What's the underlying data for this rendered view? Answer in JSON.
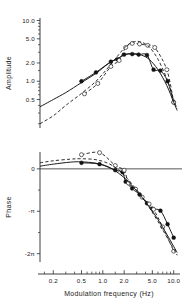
{
  "figure": {
    "caption_present": false,
    "panels": [
      "amplitude",
      "phase"
    ]
  },
  "chart_data": [
    {
      "type": "line",
      "panel": "amplitude",
      "title": "",
      "xlabel": "",
      "ylabel": "Amplitude",
      "xscale": "log",
      "yscale": "log",
      "xlim": [
        0.13,
        11.5
      ],
      "ylim": [
        0.17,
        11.0
      ],
      "grid": false,
      "legend": "none",
      "xticks": [
        0.2,
        0.5,
        1.0,
        2.0,
        5.0,
        10.0
      ],
      "xticklabels": [
        "0.2",
        "0.5",
        "1.0",
        "2.0",
        "5.0",
        "10.0"
      ],
      "yticks": [
        0.5,
        1.0,
        2.0,
        5.0,
        10.0
      ],
      "yticklabels": [
        "0.5",
        "1.0",
        "2.0",
        "5.0",
        "10.0"
      ],
      "series": [
        {
          "name": "filled-circles-solid",
          "marker": "filled-circle",
          "line": "solid",
          "x": [
            0.5,
            0.8,
            1.3,
            1.6,
            2.0,
            2.6,
            3.2,
            4.2,
            5.2,
            6.5,
            8.2,
            10.0
          ],
          "y": [
            1.0,
            1.4,
            2.1,
            2.3,
            2.75,
            2.8,
            2.75,
            2.7,
            1.55,
            1.5,
            1.0,
            0.45
          ]
        },
        {
          "name": "open-circles-dashed",
          "marker": "open-circle",
          "line": "dashed",
          "x": [
            0.55,
            0.85,
            1.3,
            1.7,
            2.1,
            2.6,
            3.3,
            4.3,
            5.4,
            8.0,
            10.0
          ],
          "y": [
            0.62,
            0.92,
            1.75,
            2.2,
            3.6,
            4.2,
            4.1,
            3.9,
            3.6,
            1.55,
            0.45
          ]
        },
        {
          "name": "fit-solid",
          "line": "solid",
          "x": [
            0.13,
            0.2,
            0.3,
            0.5,
            0.8,
            1.2,
            1.7,
            2.2,
            2.8,
            3.5,
            4.5,
            6.0,
            8.0,
            10.0,
            11.2
          ],
          "y": [
            0.38,
            0.5,
            0.65,
            0.95,
            1.35,
            1.95,
            2.45,
            2.8,
            2.85,
            2.7,
            2.3,
            1.55,
            0.85,
            0.45,
            0.33
          ]
        },
        {
          "name": "fit-dashed",
          "line": "dashed",
          "x": [
            0.13,
            0.2,
            0.3,
            0.5,
            0.8,
            1.2,
            1.7,
            2.2,
            2.8,
            3.5,
            4.5,
            6.0,
            8.0,
            10.0,
            11.2
          ],
          "y": [
            0.2,
            0.27,
            0.4,
            0.63,
            1.0,
            1.7,
            2.8,
            3.9,
            4.5,
            4.4,
            3.7,
            2.3,
            1.1,
            0.5,
            0.35
          ]
        }
      ]
    },
    {
      "type": "line",
      "panel": "phase",
      "title": "",
      "xlabel": "Modulation frequency (Hz)",
      "ylabel": "Phase",
      "xscale": "log",
      "yscale": "linear",
      "xlim": [
        0.13,
        11.5
      ],
      "ylim": [
        -6.9,
        1.25
      ],
      "grid": false,
      "legend": "none",
      "xticks": [
        0.2,
        0.5,
        1.0,
        2.0,
        5.0,
        10.0
      ],
      "xticklabels": [
        "0.2",
        "0.5",
        "1.0",
        "2.0",
        "5.0",
        "10.0"
      ],
      "yticks": [
        0,
        -3.1416,
        -6.2832
      ],
      "yticklabels": [
        "0",
        "-π",
        "-2π"
      ],
      "zero_line": true,
      "series": [
        {
          "name": "filled-circles-solid",
          "marker": "filled-circle",
          "line": "solid",
          "x": [
            0.5,
            0.9,
            1.5,
            1.9,
            2.1,
            2.6,
            3.3,
            4.2,
            5.0,
            6.5,
            8.2,
            10.0
          ],
          "y": [
            0.45,
            0.35,
            -0.1,
            -0.25,
            -0.95,
            -1.45,
            -1.9,
            -2.55,
            -2.95,
            -3.1,
            -4.1,
            -5.1
          ]
        },
        {
          "name": "open-circles-dashed",
          "marker": "open-circle",
          "line": "dashed",
          "x": [
            0.5,
            0.9,
            1.5,
            2.0,
            2.3,
            2.9,
            3.6,
            4.5,
            5.2,
            7.0,
            10.0
          ],
          "y": [
            1.05,
            1.2,
            0.25,
            -0.1,
            -1.05,
            -1.5,
            -2.1,
            -2.6,
            -3.0,
            -4.3,
            -6.1
          ]
        },
        {
          "name": "fit-solid",
          "line": "solid",
          "x": [
            0.13,
            0.2,
            0.35,
            0.5,
            0.8,
            1.2,
            1.7,
            2.2,
            2.8,
            3.5,
            4.5,
            6.0,
            8.0,
            10.0,
            11.2
          ],
          "y": [
            0.2,
            0.35,
            0.5,
            0.52,
            0.42,
            0.15,
            -0.35,
            -0.85,
            -1.45,
            -2.05,
            -2.8,
            -3.75,
            -4.85,
            -5.75,
            -6.2
          ]
        },
        {
          "name": "fit-dashed",
          "line": "dashed",
          "x": [
            0.13,
            0.2,
            0.35,
            0.5,
            0.8,
            1.2,
            1.7,
            2.2,
            2.8,
            3.5,
            4.5,
            6.0,
            8.0,
            10.0,
            11.2
          ],
          "y": [
            0.45,
            0.6,
            0.72,
            0.75,
            0.68,
            0.4,
            -0.1,
            -0.7,
            -1.35,
            -2.0,
            -2.85,
            -3.9,
            -5.05,
            -5.95,
            -6.4
          ]
        }
      ]
    }
  ]
}
